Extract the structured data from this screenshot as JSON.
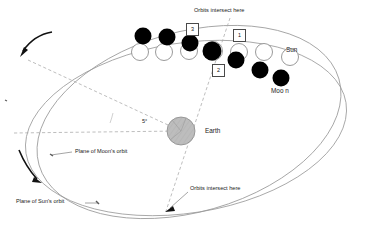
{
  "diagram": {
    "width": 381,
    "height": 234,
    "background": "#ffffff"
  },
  "colors": {
    "moon_fill": "#000000",
    "sun_fill": "#ffffff",
    "sun_stroke": "#8f8f8f",
    "earth_fill": "#b8b8b8",
    "earth_stroke": "#8a8a8a",
    "orbit_stroke": "#9a9a9a",
    "dashed_stroke": "#a8a8a8",
    "arrow_fill": "#111111",
    "text": "#1a1a1a",
    "box_border": "#4a4a4a"
  },
  "labels": {
    "orbits_intersect_top": "Orbits intersect here",
    "orbits_intersect_bottom": "Orbits intersect here",
    "sun": "Sun",
    "moon": "Moo n",
    "earth": "Earth",
    "angle": "5°",
    "plane_moon": "Plane of Moon's orbit",
    "plane_sun": "Plane of Sun's orbit"
  },
  "callout_boxes": [
    {
      "id": "box-1",
      "text": "1",
      "x": 233,
      "y": 29
    },
    {
      "id": "box-2",
      "text": "2",
      "x": 212,
      "y": 64
    },
    {
      "id": "box-3",
      "text": "3",
      "x": 186,
      "y": 23
    }
  ],
  "bodies": {
    "earth": {
      "cx": 181,
      "cy": 131,
      "r": 14
    },
    "moons": [
      {
        "cx": 143,
        "cy": 36,
        "r": 8.5
      },
      {
        "cx": 167,
        "cy": 37,
        "r": 8.5
      },
      {
        "cx": 190,
        "cy": 43,
        "r": 8.5
      },
      {
        "cx": 212,
        "cy": 51,
        "r": 9.5
      },
      {
        "cx": 236,
        "cy": 60,
        "r": 8.5
      },
      {
        "cx": 260,
        "cy": 70,
        "r": 8.5
      },
      {
        "cx": 281,
        "cy": 78,
        "r": 8.5
      }
    ],
    "suns": [
      {
        "cx": 140,
        "cy": 52,
        "r": 8.5
      },
      {
        "cx": 164,
        "cy": 52,
        "r": 8.5
      },
      {
        "cx": 189,
        "cy": 51,
        "r": 8.5
      },
      {
        "cx": 213,
        "cy": 51,
        "r": 9.5
      },
      {
        "cx": 239,
        "cy": 52,
        "r": 8.5
      },
      {
        "cx": 264,
        "cy": 52,
        "r": 8.5
      },
      {
        "cx": 290,
        "cy": 57,
        "r": 8.5
      }
    ]
  },
  "nodes": {
    "top_intersection": {
      "x": 213,
      "y": 51
    },
    "bottom_intersection": {
      "x": 166,
      "y": 211
    }
  }
}
